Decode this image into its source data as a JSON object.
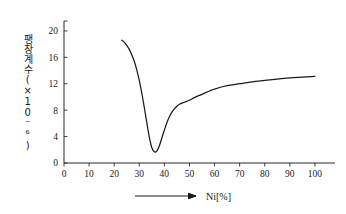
{
  "chart_data": {
    "type": "line",
    "title": "",
    "subtitle": "",
    "xlabel": "Ni[%]",
    "ylabel": "팽창계수(×10⁻⁶)",
    "ylabel_text": "팽창계수",
    "ylabel_unit": "(×10",
    "ylabel_exponent": "-6",
    "ylabel_unit_close": ")",
    "xlim": [
      0,
      108
    ],
    "ylim": [
      0,
      21.5
    ],
    "xticks": [
      0,
      10,
      20,
      30,
      40,
      50,
      60,
      70,
      80,
      90,
      100
    ],
    "yticks": [
      0,
      4,
      8,
      12,
      16,
      20
    ],
    "xtick_labels": [
      "0",
      "10",
      "20",
      "30",
      "40",
      "50",
      "60",
      "70",
      "80",
      "90",
      "100"
    ],
    "ytick_labels": [
      "0",
      "4",
      "8",
      "12",
      "16",
      "20"
    ],
    "grid": false,
    "legend": null,
    "series": [
      {
        "name": "thermal-expansion-coefficient",
        "color": "#1a1a1a",
        "x": [
          23.0,
          24.0,
          25.0,
          26.0,
          27.0,
          28.0,
          29.0,
          30.0,
          31.0,
          32.0,
          33.0,
          34.0,
          35.0,
          36.0,
          37.0,
          38.0,
          39.0,
          40.0,
          41.0,
          42.0,
          43.0,
          44.0,
          45.0,
          46.0,
          48.0,
          50.0,
          52.0,
          55.0,
          58.0,
          60.0,
          65.0,
          70.0,
          75.0,
          80.0,
          85.0,
          90.0,
          95.0,
          100.0
        ],
        "y": [
          18.6,
          18.3,
          17.8,
          17.2,
          16.4,
          15.4,
          14.1,
          12.5,
          10.6,
          8.4,
          6.1,
          3.9,
          2.3,
          1.7,
          1.8,
          2.6,
          3.8,
          5.0,
          6.1,
          7.0,
          7.7,
          8.2,
          8.6,
          8.9,
          9.2,
          9.5,
          9.9,
          10.4,
          10.9,
          11.2,
          11.7,
          12.0,
          12.3,
          12.5,
          12.7,
          12.9,
          13.0,
          13.1
        ]
      }
    ],
    "annotations": [
      {
        "name": "x-axis-arrow",
        "text": "",
        "target": "Ni[%]"
      }
    ],
    "notes": {
      "minimum_x": 35.7,
      "minimum_y": 1.7,
      "start_x": 23,
      "start_y": 18.6,
      "end_x": 100,
      "end_y": 13.1
    }
  },
  "axis_title": {
    "x": "Ni[%]"
  },
  "colors": {
    "curve": "#1a1a1a",
    "axis": "#2b2b2b",
    "background": "#ffffff",
    "text": "#1a1a1a"
  }
}
